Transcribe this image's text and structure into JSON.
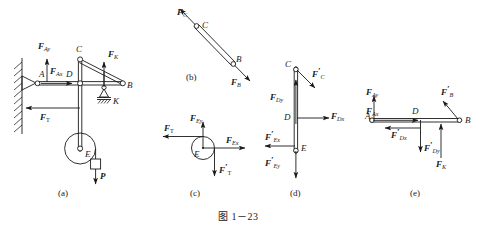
{
  "figure": {
    "caption": "图 1－23",
    "panels": [
      {
        "id": "a",
        "label": "(a)"
      },
      {
        "id": "b",
        "label": "(b)"
      },
      {
        "id": "c",
        "label": "(c)"
      },
      {
        "id": "d",
        "label": "(d)"
      },
      {
        "id": "e",
        "label": "(e)"
      }
    ]
  },
  "panel_a": {
    "name": "frame-assembly",
    "points": {
      "A": "A",
      "B": "B",
      "C": "C",
      "D": "D",
      "E": "E",
      "K": "K"
    },
    "forces": {
      "F_Ay": {
        "sym": "F",
        "sub": "Ay"
      },
      "F_Ax": {
        "sym": "F",
        "sub": "Ax"
      },
      "F_T": {
        "sym": "F",
        "sub": "T"
      },
      "F_K": {
        "sym": "F",
        "sub": "K"
      },
      "P": {
        "sym": "P",
        "sub": ""
      }
    }
  },
  "panel_b": {
    "name": "two-force-member-CB",
    "points": {
      "B": "B",
      "C": "C"
    },
    "forces": {
      "F_C": {
        "sym": "F",
        "sub": "C"
      },
      "F_B": {
        "sym": "F",
        "sub": "B"
      }
    }
  },
  "panel_c": {
    "name": "pulley-free-body-E",
    "points": {
      "E": "E"
    },
    "forces": {
      "F_T": {
        "sym": "F",
        "sub": "T"
      },
      "F_Ey": {
        "sym": "F",
        "sub": "Ey"
      },
      "F_Ex": {
        "sym": "F",
        "sub": "Ex"
      },
      "F_T_prime": {
        "sym": "F",
        "sub": "T",
        "prime": "′"
      }
    }
  },
  "panel_d": {
    "name": "vertical-member-CDE",
    "points": {
      "C": "C",
      "D": "D",
      "E": "E"
    },
    "forces": {
      "F_C_prime": {
        "sym": "F",
        "sub": "C",
        "prime": "′"
      },
      "F_Dy": {
        "sym": "F",
        "sub": "Dy"
      },
      "F_Dx": {
        "sym": "F",
        "sub": "Dx"
      },
      "F_Ex_prime": {
        "sym": "F",
        "sub": "Ex",
        "prime": "′"
      },
      "F_Ey_prime": {
        "sym": "F",
        "sub": "Ey",
        "prime": "′"
      }
    }
  },
  "panel_e": {
    "name": "horizontal-beam-AB",
    "points": {
      "A": "A",
      "B": "B",
      "D": "D"
    },
    "forces": {
      "F_Ay": {
        "sym": "F",
        "sub": "Ay"
      },
      "F_Ax": {
        "sym": "F",
        "sub": "Ax"
      },
      "F_Dx_prime": {
        "sym": "F",
        "sub": "Dx",
        "prime": "′"
      },
      "F_Dy_prime": {
        "sym": "F",
        "sub": "Dy",
        "prime": "′"
      },
      "F_K": {
        "sym": "F",
        "sub": "K"
      },
      "F_B_prime": {
        "sym": "F",
        "sub": "B",
        "prime": "′"
      }
    }
  },
  "colors": {
    "ink": "#1a1a1a",
    "background": "#ffffff"
  }
}
